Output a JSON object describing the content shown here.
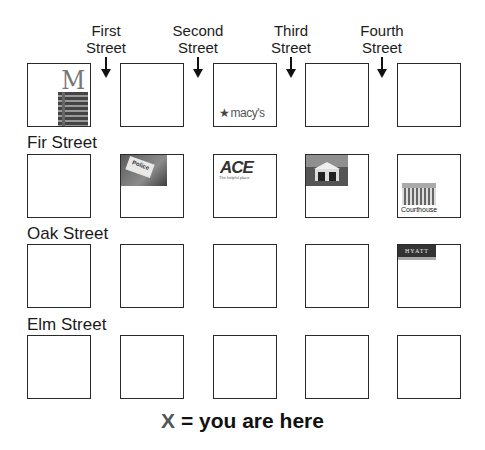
{
  "columns": [
    {
      "line1": "First",
      "line2": "Street"
    },
    {
      "line1": "Second",
      "line2": "Street"
    },
    {
      "line1": "Third",
      "line2": "Street"
    },
    {
      "line1": "Fourth",
      "line2": "Street"
    }
  ],
  "rows": [
    {
      "label": ""
    },
    {
      "label": "Fir Street"
    },
    {
      "label": "Oak Street"
    },
    {
      "label": "Elm Street"
    }
  ],
  "landmarks": {
    "mcdonalds": {
      "name": "McDonald's",
      "glyph": "M"
    },
    "macys": {
      "name": "macy's",
      "star": "★"
    },
    "police": {
      "name": "Police",
      "sign": "Police"
    },
    "ace": {
      "name": "ACE",
      "tagline": "The helpful place"
    },
    "church": {
      "name": "Church"
    },
    "courthouse": {
      "name": "Courthouse",
      "label": "Courthouse"
    },
    "hyatt": {
      "name": "HYATT",
      "label": "HYATT"
    }
  },
  "legend": {
    "symbol": "X",
    "text": " = you are here",
    "symbol_color": "#555555"
  }
}
